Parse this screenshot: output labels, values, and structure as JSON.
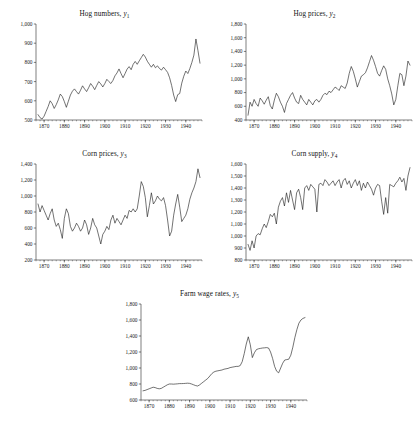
{
  "figure": {
    "background": "#ffffff",
    "line_color": "#1b1b1b",
    "axis_color": "#2a2a2a"
  },
  "chart_data": [
    {
      "id": "hog-numbers",
      "type": "line",
      "title": "Hog numbers,",
      "series_symbol": "y",
      "series_subscript": "1",
      "xlabel": "",
      "ylabel": "",
      "grid": false,
      "legend": "none",
      "xlim": [
        1866,
        1948
      ],
      "ylim": [
        500,
        1000
      ],
      "yticks": [
        500,
        600,
        700,
        800,
        900,
        1000
      ],
      "ytick_labels": [
        "500",
        "600",
        "700",
        "800",
        "900",
        "1,000"
      ],
      "xticks": [
        1870,
        1880,
        1890,
        1900,
        1910,
        1920,
        1930,
        1940
      ],
      "xtick_labels": [
        "1870",
        "1880",
        "1890",
        "1900",
        "1910",
        "1920",
        "1930",
        "1940"
      ],
      "x": [
        1867,
        1868,
        1869,
        1870,
        1871,
        1872,
        1873,
        1874,
        1875,
        1876,
        1877,
        1878,
        1879,
        1880,
        1881,
        1882,
        1883,
        1884,
        1885,
        1886,
        1887,
        1888,
        1889,
        1890,
        1891,
        1892,
        1893,
        1894,
        1895,
        1896,
        1897,
        1898,
        1899,
        1900,
        1901,
        1902,
        1903,
        1904,
        1905,
        1906,
        1907,
        1908,
        1909,
        1910,
        1911,
        1912,
        1913,
        1914,
        1915,
        1916,
        1917,
        1918,
        1919,
        1920,
        1921,
        1922,
        1923,
        1924,
        1925,
        1926,
        1927,
        1928,
        1929,
        1930,
        1931,
        1932,
        1933,
        1934,
        1935,
        1936,
        1937,
        1938,
        1939,
        1940,
        1941,
        1942,
        1943,
        1944,
        1945,
        1946,
        1947
      ],
      "values": [
        528,
        512,
        505,
        520,
        545,
        570,
        600,
        585,
        560,
        580,
        605,
        635,
        622,
        596,
        566,
        598,
        630,
        650,
        662,
        648,
        635,
        655,
        678,
        662,
        648,
        668,
        690,
        676,
        658,
        680,
        700,
        688,
        672,
        690,
        712,
        700,
        690,
        706,
        730,
        745,
        766,
        742,
        720,
        742,
        765,
        778,
        762,
        790,
        805,
        790,
        808,
        825,
        842,
        828,
        806,
        790,
        775,
        790,
        772,
        782,
        768,
        760,
        775,
        762,
        748,
        720,
        680,
        630,
        596,
        632,
        638,
        692,
        728,
        755,
        742,
        768,
        800,
        838,
        922,
        862,
        796
      ],
      "last_value_note": "series ends near 740"
    },
    {
      "id": "hog-prices",
      "type": "line",
      "title": "Hog prices,",
      "series_symbol": "y",
      "series_subscript": "2",
      "xlabel": "",
      "ylabel": "",
      "grid": false,
      "legend": "none",
      "xlim": [
        1866,
        1948
      ],
      "ylim": [
        400,
        1800
      ],
      "yticks": [
        400,
        600,
        800,
        1000,
        1200,
        1400,
        1600,
        1800
      ],
      "ytick_labels": [
        "400",
        "600",
        "800",
        "1,000",
        "1,200",
        "1,400",
        "1,600",
        "1,800"
      ],
      "xticks": [
        1870,
        1880,
        1890,
        1900,
        1910,
        1920,
        1930,
        1940
      ],
      "xtick_labels": [
        "1870",
        "1880",
        "1890",
        "1900",
        "1910",
        "1920",
        "1930",
        "1940"
      ],
      "x": [
        1867,
        1868,
        1869,
        1870,
        1871,
        1872,
        1873,
        1874,
        1875,
        1876,
        1877,
        1878,
        1879,
        1880,
        1881,
        1882,
        1883,
        1884,
        1885,
        1886,
        1887,
        1888,
        1889,
        1890,
        1891,
        1892,
        1893,
        1894,
        1895,
        1896,
        1897,
        1898,
        1899,
        1900,
        1901,
        1902,
        1903,
        1904,
        1905,
        1906,
        1907,
        1908,
        1909,
        1910,
        1911,
        1912,
        1913,
        1914,
        1915,
        1916,
        1917,
        1918,
        1919,
        1920,
        1921,
        1922,
        1923,
        1924,
        1925,
        1926,
        1927,
        1928,
        1929,
        1930,
        1931,
        1932,
        1933,
        1934,
        1935,
        1936,
        1937,
        1938,
        1939,
        1940,
        1941,
        1942,
        1943,
        1944,
        1945,
        1946,
        1947
      ],
      "values": [
        470,
        660,
        600,
        700,
        640,
        600,
        720,
        680,
        630,
        690,
        740,
        610,
        560,
        690,
        790,
        740,
        660,
        600,
        510,
        640,
        700,
        760,
        800,
        720,
        660,
        640,
        760,
        700,
        660,
        620,
        700,
        660,
        620,
        680,
        700,
        660,
        700,
        760,
        790,
        770,
        820,
        800,
        840,
        880,
        860,
        830,
        900,
        880,
        860,
        940,
        1080,
        1180,
        1110,
        1000,
        880,
        960,
        1040,
        1060,
        1090,
        1160,
        1250,
        1340,
        1270,
        1180,
        1080,
        1040,
        1120,
        1190,
        1140,
        1000,
        900,
        780,
        620,
        700,
        900,
        1080,
        1060,
        900,
        1040,
        1260,
        1200,
        1400,
        1340,
        1640
      ],
      "last_value_note": "rises sharply to ~1,640 at end"
    },
    {
      "id": "corn-prices",
      "type": "line",
      "title": "Corn prices,",
      "series_symbol": "y",
      "series_subscript": "3",
      "xlabel": "",
      "ylabel": "",
      "grid": false,
      "legend": "none",
      "xlim": [
        1866,
        1948
      ],
      "ylim": [
        200,
        1400
      ],
      "yticks": [
        200,
        400,
        600,
        800,
        1000,
        1200,
        1400
      ],
      "ytick_labels": [
        "200",
        "400",
        "600",
        "800",
        "1,000",
        "1,200",
        "1,400"
      ],
      "xticks": [
        1870,
        1880,
        1890,
        1900,
        1910,
        1920,
        1930,
        1940
      ],
      "xtick_labels": [
        "1870",
        "1880",
        "1890",
        "1900",
        "1910",
        "1920",
        "1930",
        "1940"
      ],
      "x": [
        1867,
        1868,
        1869,
        1870,
        1871,
        1872,
        1873,
        1874,
        1875,
        1876,
        1877,
        1878,
        1879,
        1880,
        1881,
        1882,
        1883,
        1884,
        1885,
        1886,
        1887,
        1888,
        1889,
        1890,
        1891,
        1892,
        1893,
        1894,
        1895,
        1896,
        1897,
        1898,
        1899,
        1900,
        1901,
        1902,
        1903,
        1904,
        1905,
        1906,
        1907,
        1908,
        1909,
        1910,
        1911,
        1912,
        1913,
        1914,
        1915,
        1916,
        1917,
        1918,
        1919,
        1920,
        1921,
        1922,
        1923,
        1924,
        1925,
        1926,
        1927,
        1928,
        1929,
        1930,
        1931,
        1932,
        1933,
        1934,
        1935,
        1936,
        1937,
        1938,
        1939,
        1940,
        1941,
        1942,
        1943,
        1944,
        1945,
        1946,
        1947
      ],
      "values": [
        900,
        800,
        880,
        820,
        760,
        700,
        780,
        840,
        700,
        620,
        660,
        580,
        470,
        720,
        840,
        780,
        620,
        560,
        600,
        660,
        620,
        560,
        600,
        700,
        640,
        520,
        600,
        720,
        640,
        600,
        500,
        400,
        520,
        560,
        620,
        580,
        700,
        760,
        660,
        720,
        680,
        640,
        700,
        760,
        720,
        820,
        800,
        840,
        800,
        840,
        1000,
        1180,
        1120,
        980,
        740,
        880,
        1040,
        900,
        940,
        1000,
        960,
        940,
        980,
        880,
        700,
        500,
        560,
        760,
        900,
        1020,
        860,
        680,
        720,
        760,
        840,
        960,
        1040,
        1100,
        1180,
        1340,
        1230,
        1140
      ],
      "last_value_note": "peak 1,340 near 1946, ends ~1,140"
    },
    {
      "id": "corn-supply",
      "type": "line",
      "title": "Corn supply,",
      "series_symbol": "y",
      "series_subscript": "4",
      "xlabel": "",
      "ylabel": "",
      "grid": false,
      "legend": "none",
      "xlim": [
        1866,
        1948
      ],
      "ylim": [
        800,
        1600
      ],
      "yticks": [
        800,
        900,
        1000,
        1100,
        1200,
        1300,
        1400,
        1500,
        1600
      ],
      "ytick_labels": [
        "800",
        "900",
        "1,000",
        "1,100",
        "1,200",
        "1,300",
        "1,400",
        "1,500",
        "1,600"
      ],
      "xticks": [
        1870,
        1880,
        1890,
        1900,
        1910,
        1920,
        1930,
        1940
      ],
      "xtick_labels": [
        "1870",
        "1880",
        "1890",
        "1900",
        "1910",
        "1920",
        "1930",
        "1940"
      ],
      "x": [
        1867,
        1868,
        1869,
        1870,
        1871,
        1872,
        1873,
        1874,
        1875,
        1876,
        1877,
        1878,
        1879,
        1880,
        1881,
        1882,
        1883,
        1884,
        1885,
        1886,
        1887,
        1888,
        1889,
        1890,
        1891,
        1892,
        1893,
        1894,
        1895,
        1896,
        1897,
        1898,
        1899,
        1900,
        1901,
        1902,
        1903,
        1904,
        1905,
        1906,
        1907,
        1908,
        1909,
        1910,
        1911,
        1912,
        1913,
        1914,
        1915,
        1916,
        1917,
        1918,
        1919,
        1920,
        1921,
        1922,
        1923,
        1924,
        1925,
        1926,
        1927,
        1928,
        1929,
        1930,
        1931,
        1932,
        1933,
        1934,
        1935,
        1936,
        1937,
        1938,
        1939,
        1940,
        1941,
        1942,
        1943,
        1944,
        1945,
        1946,
        1947
      ],
      "values": [
        930,
        880,
        960,
        900,
        1000,
        1020,
        1010,
        1060,
        1100,
        1070,
        1120,
        1180,
        1160,
        1190,
        1100,
        1240,
        1290,
        1320,
        1250,
        1360,
        1280,
        1380,
        1300,
        1220,
        1360,
        1390,
        1320,
        1220,
        1400,
        1420,
        1380,
        1430,
        1410,
        1390,
        1200,
        1430,
        1440,
        1420,
        1470,
        1450,
        1420,
        1440,
        1460,
        1420,
        1450,
        1470,
        1400,
        1460,
        1480,
        1430,
        1460,
        1400,
        1440,
        1470,
        1420,
        1460,
        1380,
        1440,
        1400,
        1450,
        1420,
        1390,
        1340,
        1400,
        1430,
        1420,
        1290,
        1180,
        1320,
        1190,
        1430,
        1420,
        1410,
        1440,
        1460,
        1490,
        1450,
        1480,
        1380,
        1500,
        1570
      ],
      "last_value_note": "ends near 1,570"
    },
    {
      "id": "farm-wage-rates",
      "type": "line",
      "title": "Farm wage rates,",
      "series_symbol": "y",
      "series_subscript": "5",
      "xlabel": "",
      "ylabel": "",
      "grid": false,
      "legend": "none",
      "xlim": [
        1866,
        1948
      ],
      "ylim": [
        600,
        1800
      ],
      "yticks": [
        600,
        800,
        1000,
        1200,
        1400,
        1600,
        1800
      ],
      "ytick_labels": [
        "600",
        "800",
        "1,000",
        "1,200",
        "1,400",
        "1,600",
        "1,800"
      ],
      "xticks": [
        1870,
        1880,
        1890,
        1900,
        1910,
        1920,
        1930,
        1940
      ],
      "xtick_labels": [
        "1870",
        "1880",
        "1890",
        "1900",
        "1910",
        "1920",
        "1930",
        "1940"
      ],
      "x": [
        1867,
        1868,
        1869,
        1870,
        1871,
        1872,
        1873,
        1874,
        1875,
        1876,
        1877,
        1878,
        1879,
        1880,
        1881,
        1882,
        1883,
        1884,
        1885,
        1886,
        1887,
        1888,
        1889,
        1890,
        1891,
        1892,
        1893,
        1894,
        1895,
        1896,
        1897,
        1898,
        1899,
        1900,
        1901,
        1902,
        1903,
        1904,
        1905,
        1906,
        1907,
        1908,
        1909,
        1910,
        1911,
        1912,
        1913,
        1914,
        1915,
        1916,
        1917,
        1918,
        1919,
        1920,
        1921,
        1922,
        1923,
        1924,
        1925,
        1926,
        1927,
        1928,
        1929,
        1930,
        1931,
        1932,
        1933,
        1934,
        1935,
        1936,
        1937,
        1938,
        1939,
        1940,
        1941,
        1942,
        1943,
        1944,
        1945,
        1946,
        1947
      ],
      "values": [
        715,
        720,
        730,
        740,
        750,
        760,
        755,
        745,
        740,
        745,
        760,
        775,
        790,
        800,
        800,
        798,
        800,
        802,
        805,
        805,
        806,
        808,
        810,
        808,
        800,
        790,
        780,
        775,
        790,
        810,
        830,
        850,
        870,
        900,
        930,
        950,
        960,
        965,
        970,
        975,
        985,
        990,
        995,
        1005,
        1010,
        1015,
        1020,
        1020,
        1030,
        1080,
        1180,
        1300,
        1390,
        1290,
        1130,
        1190,
        1230,
        1240,
        1245,
        1250,
        1252,
        1255,
        1250,
        1200,
        1120,
        1020,
        960,
        940,
        1000,
        1060,
        1100,
        1105,
        1110,
        1160,
        1260,
        1380,
        1480,
        1560,
        1600,
        1620,
        1630
      ],
      "last_value_note": "rises to ~1,630 at end"
    }
  ]
}
